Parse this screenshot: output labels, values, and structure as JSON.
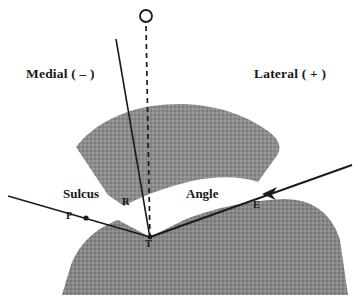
{
  "figure": {
    "background_color": "#ffffff",
    "width": 358,
    "height": 307
  },
  "orientation_labels": {
    "medial": "Medial ( – )",
    "lateral": "Lateral ( + )"
  },
  "region_labels": {
    "sulcus": "Sulcus",
    "angle": "Angle"
  },
  "point_labels": {
    "o": "O",
    "r": "R",
    "p": "P",
    "e": "E",
    "t": "T"
  },
  "colors": {
    "bone_fill": "#8d8d8d",
    "bone_fill_dark": "#7e7e7e",
    "line": "#1b1b1b",
    "text": "#181818",
    "background": "#ffffff"
  },
  "geometry": {
    "vertex": {
      "x": 150,
      "y": 237
    },
    "marker_o": {
      "x": 146,
      "y": 16,
      "radius": 6
    },
    "dashed_axis": {
      "x1": 146,
      "y1": 24,
      "x2": 150,
      "y2": 240
    },
    "solid_axis": {
      "x1": 116,
      "y1": 39,
      "x2": 150,
      "y2": 238
    },
    "left_ray": {
      "x1": 8,
      "y1": 196,
      "x2": 150,
      "y2": 237
    },
    "right_ray": {
      "x1": 150,
      "y1": 237,
      "x2": 352,
      "y2": 165
    },
    "marker_p": {
      "x": 85,
      "y": 218
    },
    "marker_e_arrow": {
      "x": 268,
      "y": 192
    }
  },
  "shapes": {
    "patella": "upper crescent / fan-shaped bone (patella) shaded gray",
    "femoral_condyles": "lower broad bone mass (femoral condyles) with central V-shaped trochlear notch"
  }
}
